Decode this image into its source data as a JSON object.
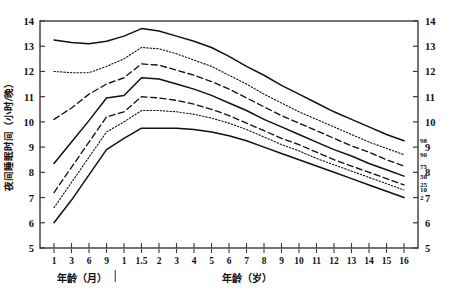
{
  "chart_data": {
    "type": "line",
    "title": "",
    "xlabel_months": "年龄（月）",
    "xlabel_years": "年龄（岁）",
    "ylabel": "夜间睡眠时间（小时/晚）",
    "ylim": [
      5,
      14
    ],
    "yticks": [
      5,
      6,
      7,
      8,
      9,
      10,
      11,
      12,
      13,
      14
    ],
    "yticks_right": [
      5,
      6,
      7,
      8,
      9,
      10,
      11,
      12,
      13,
      14
    ],
    "grid": false,
    "legend_position": "right-inline",
    "x_ticklabels_months": [
      "1",
      "3",
      "6",
      "9"
    ],
    "x_ticklabels_years": [
      "1",
      "1.5",
      "2",
      "3",
      "4",
      "5",
      "6",
      "7",
      "8",
      "9",
      "10",
      "11",
      "12",
      "13",
      "14",
      "15",
      "16"
    ],
    "x": [
      1,
      3,
      6,
      9,
      12,
      18,
      24,
      36,
      48,
      60,
      72,
      84,
      96,
      108,
      120,
      132,
      144,
      156,
      168,
      180,
      192
    ],
    "series": [
      {
        "name": "98",
        "label": "98",
        "style": "solid",
        "values": [
          13.25,
          13.15,
          13.1,
          13.2,
          13.4,
          13.7,
          13.6,
          13.4,
          13.2,
          12.95,
          12.6,
          12.2,
          11.85,
          11.45,
          11.1,
          10.75,
          10.4,
          10.1,
          9.8,
          9.5,
          9.25
        ]
      },
      {
        "name": "90",
        "label": "90",
        "style": "dotted",
        "values": [
          12.0,
          11.95,
          11.95,
          12.2,
          12.5,
          12.95,
          12.9,
          12.7,
          12.45,
          12.2,
          11.85,
          11.5,
          11.1,
          10.75,
          10.4,
          10.1,
          9.8,
          9.5,
          9.2,
          8.95,
          8.7
        ]
      },
      {
        "name": "75",
        "label": "75",
        "style": "dashed",
        "values": [
          10.1,
          10.55,
          11.1,
          11.5,
          11.75,
          12.3,
          12.25,
          12.05,
          11.85,
          11.6,
          11.3,
          10.95,
          10.6,
          10.25,
          9.95,
          9.65,
          9.35,
          9.05,
          8.8,
          8.5,
          8.25
        ]
      },
      {
        "name": "50",
        "label": "50",
        "style": "solid",
        "values": [
          8.35,
          9.2,
          10.05,
          10.95,
          11.05,
          11.75,
          11.7,
          11.5,
          11.3,
          11.05,
          10.75,
          10.45,
          10.1,
          9.8,
          9.5,
          9.2,
          8.9,
          8.65,
          8.35,
          8.1,
          7.85
        ]
      },
      {
        "name": "25",
        "label": "25",
        "style": "dashed",
        "values": [
          7.2,
          8.2,
          9.2,
          10.2,
          10.4,
          11.0,
          10.95,
          10.85,
          10.7,
          10.5,
          10.25,
          9.95,
          9.65,
          9.35,
          9.1,
          8.8,
          8.5,
          8.25,
          8.0,
          7.75,
          7.5
        ]
      },
      {
        "name": "10",
        "label": "10",
        "style": "dotted",
        "values": [
          6.6,
          7.6,
          8.6,
          9.6,
          10.0,
          10.45,
          10.45,
          10.4,
          10.3,
          10.15,
          9.95,
          9.7,
          9.4,
          9.1,
          8.85,
          8.55,
          8.3,
          8.05,
          7.8,
          7.55,
          7.3
        ]
      },
      {
        "name": "2",
        "label": "2",
        "style": "solid",
        "values": [
          6.0,
          6.9,
          7.9,
          8.9,
          9.35,
          9.75,
          9.75,
          9.75,
          9.7,
          9.6,
          9.45,
          9.25,
          9.0,
          8.75,
          8.5,
          8.25,
          8.0,
          7.75,
          7.5,
          7.25,
          7.0
        ]
      }
    ]
  }
}
